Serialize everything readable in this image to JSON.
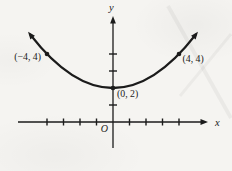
{
  "figure": {
    "background": "#f5f4f1",
    "ink": "#1b1b1b"
  },
  "chart_data": {
    "type": "line",
    "title": "",
    "xlabel": "x",
    "ylabel": "y",
    "origin_label": "O",
    "curve": {
      "form": "parabola",
      "vertex": [
        0,
        2
      ],
      "through": [
        [
          -4,
          4
        ],
        [
          4,
          4
        ]
      ]
    },
    "marked_points": [
      {
        "x": -4,
        "y": 4,
        "label": "(−4, 4)",
        "label_pos": "left"
      },
      {
        "x": 0,
        "y": 2,
        "label": "(0, 2)",
        "label_pos": "below-right"
      },
      {
        "x": 4,
        "y": 4,
        "label": "(4, 4)",
        "label_pos": "right"
      }
    ],
    "x_ticks": [
      -4,
      -3,
      -2,
      -1,
      1,
      2,
      3,
      4
    ],
    "y_ticks": [
      1,
      3,
      4
    ],
    "xlim": [
      -5.8,
      5.8
    ],
    "ylim": [
      -1.5,
      6.2
    ],
    "grid": false,
    "legend": false
  }
}
